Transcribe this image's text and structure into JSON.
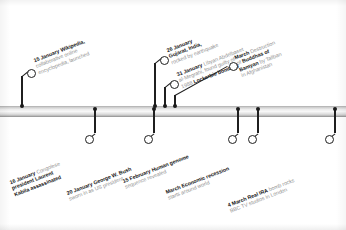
{
  "figure": {
    "type": "timeline",
    "orientation": "horizontal",
    "axis_color": "#d4d4d4",
    "marker_color": "#1f1f1f",
    "bold_text_color": "#161616",
    "body_text_color": "#8c8c8c",
    "background": "#ffffff"
  },
  "events": [
    {
      "id": "wikipedia-launched",
      "side": "above",
      "date": "15 January",
      "lead": "Wikipedia,",
      "lines": [
        "collaborative online",
        "encyclopedia, launched"
      ],
      "full_text": "15 January Wikipedia, collaborative online encyclopedia, launched"
    },
    {
      "id": "kabila-assassinated",
      "side": "below",
      "date": "16 January",
      "lead": "Congolese",
      "lines": [
        "president Laurent",
        "Kabila assassinated"
      ],
      "bold_lines": [
        "president Laurent"
      ],
      "full_text": "16 January Congolese president Laurent Kabila assassinated"
    },
    {
      "id": "bush-sworn-in",
      "side": "below",
      "date": "20 January",
      "lead": "George W. Bush",
      "lines": [
        "sworn in as US president"
      ],
      "full_text": "20 January George W. Bush sworn in as US president"
    },
    {
      "id": "gujarat-earthquake",
      "side": "above",
      "date": "26 January",
      "lead": "",
      "lines": [
        "Gujarat, India,",
        "rocked by earthquake"
      ],
      "full_text": "26 January Gujarat, India, rocked by earthquake"
    },
    {
      "id": "lockerbie-verdict",
      "side": "above",
      "date": "31 January",
      "lead": "Libyan Abdelbaset",
      "lines": [
        "al-Megrahi, found guilty of",
        "1988 Lockerbie bombing"
      ],
      "full_text": "31 January Libyan Abdelbaset al-Megrahi, found guilty of 1988 Lockerbie bombing"
    },
    {
      "id": "human-genome",
      "side": "below",
      "date": "15 February",
      "lead": "Human genome",
      "lines": [
        "sequence revealed"
      ],
      "full_text": "15 February Human genome sequence revealed"
    },
    {
      "id": "buddhas-of-bamyan",
      "side": "above",
      "date": "March",
      "lead": "Destruction",
      "lines": [
        "of Buddhas of",
        "Bamyan by Taliban",
        "in Afghanistan"
      ],
      "full_text": "March Destruction of Buddhas of Bamyan by Taliban in Afghanistan"
    },
    {
      "id": "economic-recession",
      "side": "below",
      "date": "March",
      "lead": "Economic recession",
      "lines": [
        "starts around world"
      ],
      "full_text": "March Economic recession starts around world"
    },
    {
      "id": "real-ira-bbc-bomb",
      "side": "below",
      "date": "4 March",
      "lead": "Real IRA",
      "lines": [
        "bomb rocks",
        "BBC TV studios in London"
      ],
      "full_text": "4 March Real IRA bomb rocks BBC TV studios in London"
    }
  ],
  "labels": {
    "e0": {
      "l0": "15 January",
      "l1": "Wikipedia,",
      "l2": "collaborative online",
      "l3": "encyclopedia, launched"
    },
    "e1": {
      "l0": "16 January",
      "l1": "Congolese",
      "l2": "president Laurent",
      "l3": "Kabila assassinated"
    },
    "e2": {
      "l0": "20 January",
      "l1": "George W. Bush",
      "l2": "sworn in as US president"
    },
    "e3": {
      "l0": "26 January",
      "l1": "Gujarat, India,",
      "l2": "rocked by earthquake"
    },
    "e4": {
      "l0": "31 January",
      "l1": "Libyan Abdelbaset",
      "l2": "al-Megrahi, found guilty of",
      "l3": "1988",
      "l4": "Lockerbie bombing"
    },
    "e5": {
      "l0": "15 February",
      "l1": "Human genome",
      "l2": "sequence revealed"
    },
    "e6": {
      "l0": "March",
      "l1": "Destruction",
      "l2": "of",
      "l3": "Buddhas of",
      "l4": "Bamyan",
      "l5": "by Taliban",
      "l6": "in Afghanistan"
    },
    "e7": {
      "l0": "March",
      "l1": "Economic recession",
      "l2": "starts around world"
    },
    "e8": {
      "l0": "4 March",
      "l1": "Real IRA",
      "l2": "bomb rocks",
      "l3": "BBC TV studios in London"
    }
  }
}
